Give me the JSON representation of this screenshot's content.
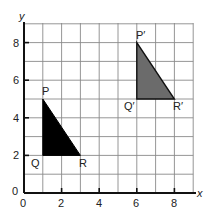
{
  "diagram": {
    "type": "coordinate-grid-translation",
    "axes": {
      "x_label": "x",
      "y_label": "y",
      "x_range": [
        0,
        9
      ],
      "y_range": [
        0,
        9
      ],
      "x_ticks": [
        "0",
        "2",
        "4",
        "6",
        "8"
      ],
      "y_ticks": [
        "0",
        "2",
        "4",
        "6",
        "8"
      ],
      "grid": true
    },
    "shapes": [
      {
        "name": "PQR",
        "fill": "#000000",
        "vertices": [
          {
            "label": "P",
            "x": 1,
            "y": 5
          },
          {
            "label": "Q",
            "x": 1,
            "y": 2
          },
          {
            "label": "R",
            "x": 3,
            "y": 2
          }
        ]
      },
      {
        "name": "P'Q'R'",
        "fill": "#6b6b6b",
        "vertices": [
          {
            "label": "P′",
            "x": 6,
            "y": 8
          },
          {
            "label": "Q′",
            "x": 6,
            "y": 5
          },
          {
            "label": "R′",
            "x": 8,
            "y": 5
          }
        ]
      }
    ]
  }
}
